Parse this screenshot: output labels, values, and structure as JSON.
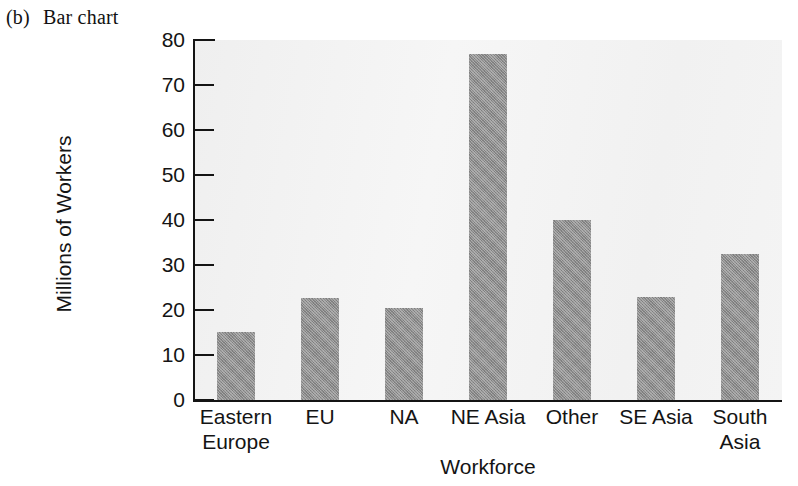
{
  "caption": {
    "tag": "(b)",
    "text": "Bar chart"
  },
  "chart_data": {
    "type": "bar",
    "title": "",
    "xlabel": "Workforce",
    "ylabel": "Millions of Workers",
    "categories": [
      "Eastern Europe",
      "EU",
      "NA",
      "NE Asia",
      "Other",
      "SE Asia",
      "South Asia"
    ],
    "category_lines": [
      [
        "Eastern",
        "Europe"
      ],
      [
        "EU",
        ""
      ],
      [
        "NA",
        ""
      ],
      [
        "NE Asia",
        ""
      ],
      [
        "Other",
        ""
      ],
      [
        "SE Asia",
        ""
      ],
      [
        "South",
        "Asia"
      ]
    ],
    "values": [
      15.2,
      22.6,
      20.4,
      77.0,
      40.0,
      22.8,
      32.4
    ],
    "ylim": [
      0,
      80
    ],
    "yticks": [
      0,
      10,
      20,
      30,
      40,
      50,
      60,
      70,
      80
    ],
    "ytick_labels": [
      "0",
      "10",
      "20",
      "30",
      "40",
      "50",
      "60",
      "70",
      "80"
    ],
    "grid": false,
    "legend": false,
    "bar_color": "#8c8c8c",
    "plot_background": "#f3f3f3",
    "axis_color": "#141414"
  }
}
